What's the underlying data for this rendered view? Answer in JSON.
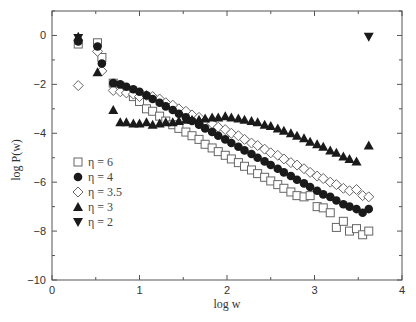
{
  "chart_data": {
    "type": "scatter",
    "title": "",
    "xlabel": "log w",
    "ylabel": "log P(w)",
    "xlim": [
      0,
      4
    ],
    "ylim": [
      -10,
      1
    ],
    "xticks": [
      0,
      1,
      2,
      3,
      4
    ],
    "yticks": [
      0,
      -2,
      -4,
      -6,
      -8,
      -10
    ],
    "grid": false,
    "legend_position": "left-center",
    "series": [
      {
        "name": "η = 6",
        "marker": "open-square",
        "x": [
          0.3,
          0.52,
          0.57,
          0.7,
          0.78,
          0.85,
          0.93,
          1.0,
          1.08,
          1.15,
          1.23,
          1.3,
          1.38,
          1.45,
          1.53,
          1.6,
          1.68,
          1.75,
          1.83,
          1.9,
          1.98,
          2.05,
          2.13,
          2.2,
          2.28,
          2.35,
          2.43,
          2.5,
          2.58,
          2.65,
          2.73,
          2.8,
          2.88,
          2.95,
          3.03,
          3.1,
          3.18,
          3.25,
          3.33,
          3.4,
          3.48,
          3.55,
          3.62
        ],
        "y": [
          -0.35,
          -0.3,
          -0.9,
          -1.95,
          -2.1,
          -2.25,
          -2.5,
          -2.7,
          -3.0,
          -3.1,
          -3.3,
          -3.5,
          -3.65,
          -3.8,
          -3.95,
          -4.1,
          -4.25,
          -4.45,
          -4.6,
          -4.75,
          -4.9,
          -5.05,
          -5.2,
          -5.35,
          -5.5,
          -5.65,
          -5.8,
          -5.95,
          -6.1,
          -6.25,
          -6.4,
          -6.55,
          -6.6,
          -6.55,
          -7.0,
          -7.05,
          -7.25,
          -7.85,
          -7.6,
          -8.0,
          -7.9,
          -8.15,
          -8.0
        ]
      },
      {
        "name": "η = 4",
        "marker": "filled-circle",
        "x": [
          0.3,
          0.52,
          0.57,
          0.7,
          0.78,
          0.85,
          0.93,
          1.0,
          1.08,
          1.15,
          1.23,
          1.3,
          1.38,
          1.45,
          1.53,
          1.6,
          1.68,
          1.75,
          1.83,
          1.9,
          1.98,
          2.05,
          2.13,
          2.2,
          2.28,
          2.35,
          2.43,
          2.5,
          2.58,
          2.65,
          2.73,
          2.8,
          2.88,
          2.95,
          3.03,
          3.1,
          3.18,
          3.25,
          3.33,
          3.4,
          3.48,
          3.55,
          3.62
        ],
        "y": [
          -0.25,
          -0.45,
          -1.15,
          -1.95,
          -2.0,
          -2.1,
          -2.2,
          -2.3,
          -2.45,
          -2.6,
          -2.75,
          -2.9,
          -3.05,
          -3.2,
          -3.35,
          -3.5,
          -3.65,
          -3.8,
          -3.95,
          -4.1,
          -4.25,
          -4.4,
          -4.55,
          -4.7,
          -4.85,
          -5.0,
          -5.15,
          -5.3,
          -5.45,
          -5.6,
          -5.75,
          -5.9,
          -6.05,
          -6.2,
          -6.35,
          -6.5,
          -6.6,
          -6.75,
          -6.9,
          -7.0,
          -7.1,
          -7.25,
          -7.1
        ]
      },
      {
        "name": "η = 3.5",
        "marker": "open-diamond",
        "x": [
          0.3,
          0.52,
          0.57,
          0.7,
          0.78,
          0.85,
          0.93,
          1.0,
          1.08,
          1.15,
          1.23,
          1.3,
          1.38,
          1.45,
          1.53,
          1.6,
          1.68,
          1.75,
          1.83,
          1.9,
          1.98,
          2.05,
          2.13,
          2.2,
          2.28,
          2.35,
          2.43,
          2.5,
          2.58,
          2.65,
          2.73,
          2.8,
          2.88,
          2.95,
          3.03,
          3.1,
          3.18,
          3.25,
          3.33,
          3.4,
          3.48,
          3.55,
          3.62
        ],
        "y": [
          -2.05,
          -0.65,
          -1.45,
          -2.25,
          -2.3,
          -2.35,
          -2.4,
          -2.5,
          -2.45,
          -2.5,
          -2.6,
          -2.75,
          -2.85,
          -3.0,
          -3.1,
          -3.25,
          -3.35,
          -3.5,
          -3.6,
          -3.75,
          -3.85,
          -4.0,
          -4.1,
          -4.25,
          -4.4,
          -4.5,
          -4.65,
          -4.8,
          -4.9,
          -5.05,
          -5.2,
          -5.3,
          -5.45,
          -5.6,
          -5.75,
          -5.85,
          -6.0,
          -6.1,
          -6.25,
          -6.35,
          -6.3,
          -6.55,
          -6.6
        ]
      },
      {
        "name": "η = 3",
        "marker": "filled-triangle-up",
        "x": [
          0.3,
          0.52,
          0.7,
          0.78,
          0.85,
          0.93,
          1.0,
          1.08,
          1.15,
          1.23,
          1.3,
          1.38,
          1.45,
          1.53,
          1.6,
          1.68,
          1.75,
          1.83,
          1.9,
          1.98,
          2.05,
          2.13,
          2.2,
          2.28,
          2.35,
          2.43,
          2.5,
          2.58,
          2.65,
          2.73,
          2.8,
          2.88,
          2.95,
          3.03,
          3.1,
          3.18,
          3.25,
          3.33,
          3.4,
          3.48,
          3.62
        ],
        "y": [
          -0.05,
          -1.5,
          -3.05,
          -3.55,
          -3.55,
          -3.6,
          -3.6,
          -3.55,
          -3.65,
          -3.6,
          -3.55,
          -3.55,
          -3.5,
          -3.45,
          -3.45,
          -3.45,
          -3.4,
          -3.35,
          -3.35,
          -3.3,
          -3.35,
          -3.4,
          -3.45,
          -3.5,
          -3.55,
          -3.65,
          -3.7,
          -3.8,
          -3.9,
          -4.0,
          -4.1,
          -4.2,
          -4.35,
          -4.45,
          -4.55,
          -4.7,
          -4.8,
          -4.95,
          -5.05,
          -5.15,
          -4.5
        ]
      },
      {
        "name": "η = 2",
        "marker": "filled-triangle-down",
        "x": [
          0.3,
          3.62
        ],
        "y": [
          -0.1,
          -0.05
        ]
      }
    ]
  }
}
